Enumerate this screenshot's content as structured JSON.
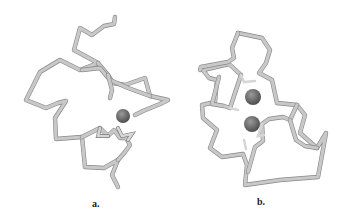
{
  "figure": {
    "panels": [
      {
        "label": "a.",
        "description": "protein backbone with one metal ion"
      },
      {
        "label": "b.",
        "description": "protein backbone with two metal ions"
      }
    ],
    "colors": {
      "backbone": "#c8c8c8",
      "metal_ion": "#6e6e6e",
      "background": "#ffffff"
    }
  }
}
